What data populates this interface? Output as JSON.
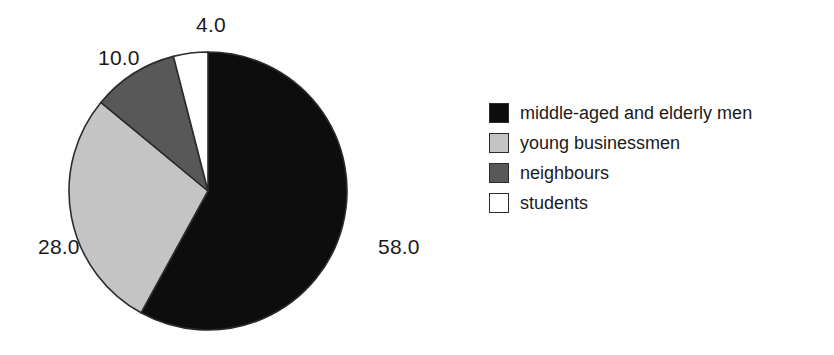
{
  "chart_data": {
    "type": "pie",
    "title": "",
    "subtitle": "",
    "xlabel": "",
    "ylabel": "",
    "categories": [
      "middle-aged and elderly men",
      "young businessmen",
      "neighbours",
      "students"
    ],
    "values": [
      58.0,
      28.0,
      10.0,
      4.0
    ],
    "value_labels": [
      "58.0",
      "28.0",
      "10.0",
      "4.0"
    ],
    "colors": [
      "#0d0d0d",
      "#c4c4c4",
      "#585858",
      "#ffffff"
    ],
    "slice_edge_color": "#2b2b2b",
    "start_angle_deg": 90,
    "direction": "clockwise",
    "total": 100.0,
    "legend": {
      "position": "right",
      "entries": [
        {
          "label": "middle-aged and elderly men",
          "color": "#0d0d0d",
          "value": 58.0
        },
        {
          "label": "young businessmen",
          "color": "#c4c4c4",
          "value": 28.0
        },
        {
          "label": "neighbours",
          "color": "#585858",
          "value": 10.0
        },
        {
          "label": "students",
          "color": "#ffffff",
          "value": 4.0
        }
      ]
    },
    "grid": false,
    "axis_ranges": null
  },
  "pie": {
    "center_x": 208,
    "center_y": 191,
    "radius": 139,
    "labels": {
      "middle_aged_and_elderly_men": "58.0",
      "young_businessmen": "28.0",
      "neighbours": "10.0",
      "students": "4.0"
    }
  }
}
